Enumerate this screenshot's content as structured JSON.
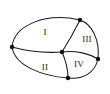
{
  "figure": {
    "type": "planar-graph-diagram",
    "width": 110,
    "height": 94,
    "background_color": "#ffffff",
    "stroke_color": "#1a1a1a",
    "vertex_color": "#111111",
    "label_color": "#1a1a1a"
  },
  "regions": [
    {
      "id": "region-1",
      "label": "I",
      "label_x": 45,
      "label_y": 33
    },
    {
      "id": "region-2",
      "label": "II",
      "label_x": 45,
      "label_y": 68
    },
    {
      "id": "region-3",
      "label": "III",
      "label_x": 87,
      "label_y": 40
    },
    {
      "id": "region-4",
      "label": "IV",
      "label_x": 79,
      "label_y": 65
    }
  ],
  "vertices": [
    {
      "id": "vertex-left",
      "x": 12,
      "y": 47,
      "r": 2.2,
      "on_boundary": true
    },
    {
      "id": "vertex-top",
      "x": 80,
      "y": 20,
      "r": 2.2,
      "on_boundary": true
    },
    {
      "id": "vertex-right",
      "x": 98,
      "y": 59,
      "r": 2.2,
      "on_boundary": true
    },
    {
      "id": "vertex-bottom",
      "x": 68,
      "y": 78,
      "r": 2.2,
      "on_boundary": true
    },
    {
      "id": "vertex-center",
      "x": 62,
      "y": 52,
      "r": 2.2,
      "on_boundary": false
    }
  ],
  "edges": [
    {
      "id": "edge-outer-top-left",
      "path": "M 12 47 C 14 26, 44 12, 80 20"
    },
    {
      "id": "edge-outer-top-right",
      "path": "M 80 20 C 92 24, 100 40, 98 59"
    },
    {
      "id": "edge-outer-bottom-right",
      "path": "M 98 59 C 95 72, 84 80, 68 78"
    },
    {
      "id": "edge-outer-bottom-left",
      "path": "M 68 78 C 42 76, 15 66, 12 47"
    },
    {
      "id": "edge-left-to-center",
      "path": "M 12 47 C 30 52, 48 53, 62 52"
    },
    {
      "id": "edge-top-to-center",
      "path": "M 80 20 C 74 32, 67 44, 62 52"
    },
    {
      "id": "edge-center-to-right",
      "path": "M 62 52 C 76 50, 90 54, 98 59"
    },
    {
      "id": "edge-center-to-bottom",
      "path": "M 62 52 C 66 61, 68 70, 68 78"
    }
  ]
}
